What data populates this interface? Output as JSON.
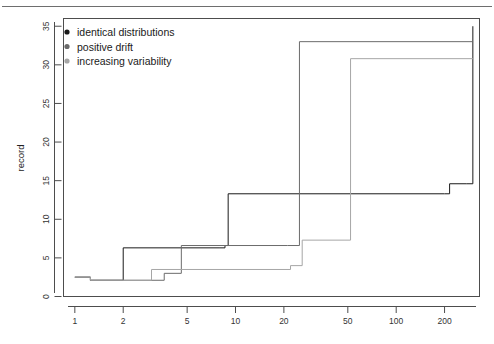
{
  "figure": {
    "background_color": "#ffffff",
    "frame_color": "#4d4d4d",
    "top_rule": true
  },
  "chart_data": {
    "type": "line",
    "title": "",
    "subtitle": "",
    "xlabel": "",
    "ylabel": "record",
    "xscale": "log",
    "yscale": "linear",
    "xlim": [
      0.85,
      330
    ],
    "ylim": [
      0,
      36
    ],
    "grid": false,
    "legend_position": "top-left",
    "x_tick_labels": [
      "1",
      "2",
      "5",
      "10",
      "20",
      "50",
      "100",
      "200"
    ],
    "x_tick_values": [
      1,
      2,
      5,
      10,
      20,
      50,
      100,
      200
    ],
    "y_tick_labels": [
      "0",
      "5",
      "10",
      "15",
      "20",
      "25",
      "30",
      "35"
    ],
    "y_tick_values": [
      0,
      5,
      10,
      15,
      20,
      25,
      30,
      35
    ],
    "series": [
      {
        "name": "identical distributions",
        "color": "#1a1a1a",
        "marker": "filled-circle",
        "step": "post",
        "x": [
          1,
          1.25,
          2.0,
          8.0,
          8.6,
          9.0,
          200,
          215,
          275,
          300
        ],
        "y": [
          2.5,
          2.1,
          6.3,
          6.3,
          6.6,
          13.3,
          13.3,
          14.6,
          14.6,
          35.0
        ]
      },
      {
        "name": "positive drift",
        "color": "#6b6b6b",
        "marker": "filled-circle",
        "step": "post",
        "x": [
          1,
          1.25,
          3.6,
          4.6,
          21.0,
          25.0,
          300
        ],
        "y": [
          2.5,
          2.1,
          3.0,
          6.6,
          6.6,
          33.0,
          33.0
        ]
      },
      {
        "name": "increasing variability",
        "color": "#a6a6a6",
        "marker": "filled-circle",
        "step": "post",
        "x": [
          1,
          1.25,
          3.0,
          22.0,
          26.0,
          48.0,
          52.0,
          300
        ],
        "y": [
          2.5,
          2.1,
          3.5,
          4.0,
          7.3,
          7.3,
          30.8,
          30.8
        ]
      }
    ]
  },
  "legend": {
    "entries": [
      {
        "label": "identical distributions",
        "color": "#1a1a1a"
      },
      {
        "label": "positive drift",
        "color": "#6b6b6b"
      },
      {
        "label": "increasing variability",
        "color": "#a6a6a6"
      }
    ]
  },
  "axes": {
    "y_axis_title": "record",
    "x_axis_title": ""
  }
}
